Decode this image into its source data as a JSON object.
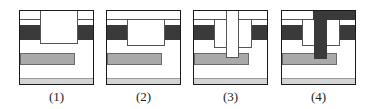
{
  "figure": {
    "panels": [
      {
        "label": "(1)",
        "step": "trench etched through top layers"
      },
      {
        "label": "(2)",
        "step": "trench with continuous top layer"
      },
      {
        "label": "(3)",
        "step": "via etched down to lower conductor"
      },
      {
        "label": "(4)",
        "step": "metal filled into via and trench"
      }
    ]
  },
  "colors": {
    "border": "#1a1a1a",
    "dark_layer": "#3a3a3a",
    "gray_conductor": "#a9a9a9",
    "bottom_layer": "#d4d4d4",
    "background": "#ffffff"
  }
}
